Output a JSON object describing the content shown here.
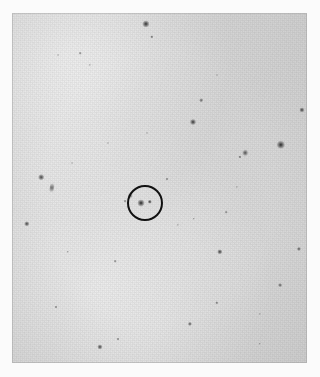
{
  "figure": {
    "kind": "astronomical-finding-chart",
    "width_px": 320,
    "height_px": 377
  },
  "plate": {
    "left_px": 12,
    "top_px": 13,
    "width_px": 295,
    "height_px": 350,
    "background_color": "#d9d9d9",
    "margin_color": "#fbfbfb",
    "source_color": "#2b2b2b",
    "marker_color": "#111111"
  },
  "marker": {
    "shape": "circle",
    "center_x": 145,
    "center_y": 203,
    "radius_px": 18,
    "stroke_width_px": 2.6,
    "label": "target-marker"
  },
  "chart_data": {
    "type": "scatter",
    "title": "",
    "subtitle": "",
    "xlabel": "",
    "ylabel": "",
    "grid": false,
    "legend": "none",
    "xlim": [
      0,
      295
    ],
    "ylim": [
      0,
      350
    ],
    "axis_note": "pixel coordinates on the plate cut-out; y increases downward",
    "series": [
      {
        "name": "point sources",
        "columns": [
          "x",
          "y",
          "size",
          "darkness",
          "elongation"
        ],
        "points": [
          [
            134,
            11,
            7.2,
            0.88,
            1.0
          ],
          [
            140,
            24,
            3.4,
            0.55,
            1.0
          ],
          [
            68,
            40,
            2.6,
            0.34,
            1.0
          ],
          [
            46,
            42,
            2.0,
            0.26,
            1.0
          ],
          [
            78,
            52,
            2.2,
            0.28,
            1.0
          ],
          [
            189,
            87,
            3.6,
            0.5,
            1.0
          ],
          [
            205,
            62,
            2.0,
            0.24,
            1.0
          ],
          [
            181,
            109,
            6.0,
            0.82,
            1.0
          ],
          [
            290,
            97,
            5.2,
            0.78,
            1.0
          ],
          [
            269,
            132,
            8.4,
            0.92,
            1.0
          ],
          [
            233,
            140,
            4.6,
            0.66,
            1.6
          ],
          [
            228,
            144,
            3.2,
            0.52,
            1.0
          ],
          [
            29,
            164,
            5.6,
            0.74,
            1.0
          ],
          [
            40,
            175,
            4.4,
            0.46,
            2.6
          ],
          [
            155,
            166,
            3.0,
            0.4,
            1.0
          ],
          [
            118,
            183,
            3.6,
            0.44,
            1.8
          ],
          [
            113,
            188,
            2.8,
            0.36,
            1.0
          ],
          [
            15,
            211,
            5.4,
            0.76,
            1.0
          ],
          [
            182,
            206,
            2.4,
            0.3,
            1.0
          ],
          [
            214,
            199,
            2.6,
            0.32,
            1.0
          ],
          [
            166,
            212,
            2.2,
            0.26,
            1.0
          ],
          [
            56,
            239,
            2.4,
            0.3,
            1.0
          ],
          [
            208,
            239,
            5.4,
            0.78,
            1.0
          ],
          [
            287,
            236,
            4.2,
            0.64,
            1.0
          ],
          [
            103,
            248,
            2.6,
            0.34,
            1.0
          ],
          [
            268,
            272,
            3.8,
            0.56,
            1.0
          ],
          [
            44,
            294,
            3.0,
            0.4,
            1.0
          ],
          [
            205,
            290,
            3.4,
            0.46,
            1.0
          ],
          [
            178,
            311,
            4.2,
            0.62,
            1.0
          ],
          [
            106,
            326,
            3.0,
            0.4,
            1.0
          ],
          [
            88,
            334,
            5.2,
            0.76,
            1.0
          ],
          [
            248,
            331,
            2.4,
            0.28,
            1.0
          ],
          [
            248,
            301,
            2.2,
            0.26,
            1.0
          ],
          [
            135,
            120,
            2.0,
            0.22,
            1.0
          ],
          [
            96,
            130,
            2.0,
            0.22,
            1.0
          ],
          [
            60,
            150,
            2.0,
            0.22,
            1.0
          ],
          [
            225,
            174,
            2.2,
            0.24,
            1.0
          ]
        ]
      },
      {
        "name": "marked target pair",
        "columns": [
          "x",
          "y",
          "size",
          "darkness",
          "elongation"
        ],
        "points": [
          [
            129,
            190,
            7.0,
            0.93,
            1.0
          ],
          [
            138,
            189,
            4.4,
            0.82,
            1.0
          ]
        ]
      }
    ]
  }
}
